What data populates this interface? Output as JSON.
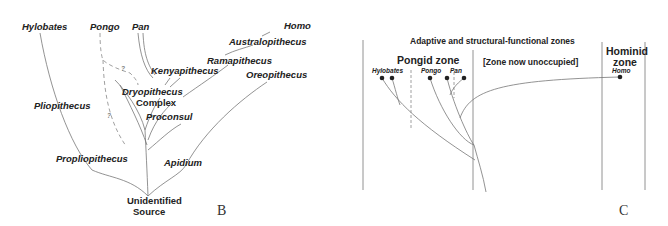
{
  "panel_b": {
    "letter": "B",
    "taxa": {
      "hylobates": "Hylobates",
      "pongo": "Pongo",
      "pan": "Pan",
      "homo": "Homo",
      "australopithecus": "Australopithecus",
      "ramapithecus": "Ramapithecus",
      "kenyapithecus": "Kenyapithecus",
      "oreopithecus": "Oreopithecus",
      "dryopithecus": "Dryopithecus",
      "complex": "Complex",
      "pliopithecus": "Pliopithecus",
      "proconsul": "Proconsul",
      "propliopithecus": "Propliopithecus",
      "apidium": "Apidium",
      "source_line1": "Unidentified",
      "source_line2": "Source"
    },
    "uncertain_marks": [
      "?",
      "?"
    ]
  },
  "panel_c": {
    "letter": "C",
    "title": "Adaptive and structural-functional zones",
    "zones": {
      "pongid": "Pongid zone",
      "unoccupied": "[Zone now unoccupied]",
      "hominid_line1": "Hominid",
      "hominid_line2": "zone"
    },
    "taxa": {
      "hylobates": "Hylobates",
      "pongo": "Pongo",
      "pan": "Pan",
      "homo": "Homo"
    }
  }
}
